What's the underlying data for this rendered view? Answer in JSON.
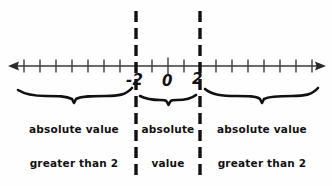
{
  "figure": {
    "kind": "number-line-diagram",
    "background_color": "#fefefe",
    "ink_color": "#111111"
  },
  "number_line": {
    "name": "real-number-line",
    "left_arrow": "left-arrowhead",
    "right_arrow": "right-arrowhead",
    "tick_count": 19,
    "tick_spacing_px": 16,
    "origin_x_px": 168,
    "axis_y_px": 66
  },
  "boundaries": [
    {
      "name": "boundary-negative-two",
      "value": -2,
      "x_px": 136,
      "style": "dashed"
    },
    {
      "name": "boundary-positive-two",
      "value": 2,
      "x_px": 200,
      "style": "dashed"
    }
  ],
  "axis_labels": [
    {
      "name": "axis-label-negative-two",
      "text": "-2"
    },
    {
      "name": "axis-label-zero",
      "text": "0"
    },
    {
      "name": "axis-label-positive-two",
      "text": "2"
    }
  ],
  "regions": [
    {
      "name": "region-left",
      "brace": "brace-left",
      "lines": [
        "absolute value",
        "greater than 2"
      ],
      "text": "absolute value greater than 2"
    },
    {
      "name": "region-middle",
      "brace": "brace-middle",
      "lines": [
        "absolute",
        "value",
        "less",
        "than 2"
      ],
      "text": "absolute value less than 2"
    },
    {
      "name": "region-right",
      "brace": "brace-right",
      "lines": [
        "absolute value",
        "greater than 2"
      ],
      "text": "absolute value greater than 2"
    }
  ]
}
